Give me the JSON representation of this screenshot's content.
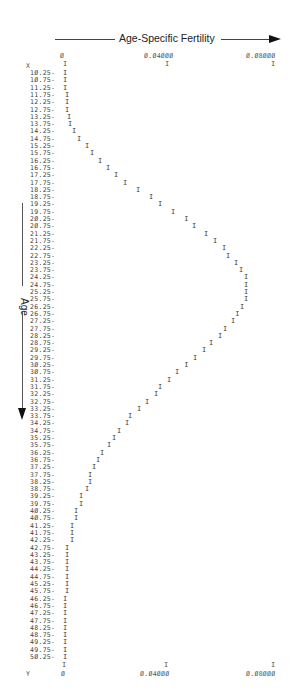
{
  "chart_data": {
    "type": "line",
    "title": "Age-Specific Fertility",
    "xlabel": "Age-Specific Fertility",
    "ylabel": "Age",
    "orientation": "horizontal-value-axis, vertical-age-axis (line printer plot)",
    "value_axis": {
      "ticks": [
        "0",
        "0.04000",
        "0.08000"
      ],
      "tick_display": [
        "Ø",
        "Ø.Ø4ØØØ",
        "Ø.Ø8ØØØ"
      ],
      "range": [
        0,
        0.08
      ]
    },
    "corner_labels": {
      "top_left": "X",
      "bottom_left": "Y"
    },
    "plot_symbol": "I",
    "ages": [
      10.25,
      10.75,
      11.25,
      11.75,
      12.25,
      12.75,
      13.25,
      13.75,
      14.25,
      14.75,
      15.25,
      15.75,
      16.25,
      16.75,
      17.25,
      17.75,
      18.25,
      18.75,
      19.25,
      19.75,
      20.25,
      20.75,
      21.25,
      21.75,
      22.25,
      22.75,
      23.25,
      23.75,
      24.25,
      24.75,
      25.25,
      25.75,
      26.25,
      26.75,
      27.25,
      27.75,
      28.25,
      28.75,
      29.25,
      29.75,
      30.25,
      30.75,
      31.25,
      31.75,
      32.25,
      32.75,
      33.25,
      33.75,
      34.25,
      34.75,
      35.25,
      35.75,
      36.25,
      36.75,
      37.25,
      37.75,
      38.25,
      38.75,
      39.25,
      39.75,
      40.25,
      40.75,
      41.25,
      41.75,
      42.25,
      42.75,
      43.25,
      43.75,
      44.25,
      44.75,
      45.25,
      45.75,
      46.25,
      46.75,
      47.25,
      47.75,
      48.25,
      48.75,
      49.25,
      49.75,
      50.25
    ],
    "age_labels": [
      "1Ø.25-",
      "1Ø.75-",
      "11.25-",
      "11.75-",
      "12.25-",
      "12.75-",
      "13.25-",
      "13.75-",
      "14.25-",
      "14.75-",
      "15.25-",
      "15.75-",
      "16.25-",
      "16.75-",
      "17.25-",
      "17.75-",
      "18.25-",
      "18.75-",
      "19.25-",
      "19.75-",
      "2Ø.25-",
      "2Ø.75-",
      "21.25-",
      "21.75-",
      "22.25-",
      "22.75-",
      "23.25-",
      "23.75-",
      "24.25-",
      "24.75-",
      "25.25-",
      "25.75-",
      "26.25-",
      "26.75-",
      "27.25-",
      "27.75-",
      "28.25-",
      "28.75-",
      "29.25-",
      "29.75-",
      "3Ø.25-",
      "3Ø.75-",
      "31.25-",
      "31.75-",
      "32.25-",
      "32.75-",
      "33.25-",
      "33.75-",
      "34.25-",
      "34.75-",
      "35.25-",
      "35.75-",
      "36.25-",
      "36.75-",
      "37.25-",
      "37.75-",
      "38.25-",
      "38.75-",
      "39.25-",
      "39.75-",
      "4Ø.25-",
      "4Ø.75-",
      "41.25-",
      "41.75-",
      "42.25-",
      "42.75-",
      "43.25-",
      "43.75-",
      "44.25-",
      "44.75-",
      "45.25-",
      "45.75-",
      "46.25-",
      "46.75-",
      "47.25-",
      "47.75-",
      "48.25-",
      "48.75-",
      "49.25-",
      "49.75-",
      "5Ø.25-"
    ],
    "values": [
      0.0,
      0.0,
      0.0,
      0.0008,
      0.0008,
      0.0008,
      0.0016,
      0.002,
      0.0035,
      0.0055,
      0.0086,
      0.0106,
      0.0137,
      0.0169,
      0.02,
      0.0235,
      0.0286,
      0.0337,
      0.0373,
      0.0424,
      0.0475,
      0.0506,
      0.0553,
      0.0588,
      0.0624,
      0.0639,
      0.0671,
      0.069,
      0.071,
      0.071,
      0.071,
      0.071,
      0.0694,
      0.0675,
      0.0659,
      0.0627,
      0.0608,
      0.0573,
      0.0545,
      0.051,
      0.0475,
      0.0439,
      0.0408,
      0.0373,
      0.0357,
      0.0322,
      0.029,
      0.0255,
      0.0243,
      0.0212,
      0.0192,
      0.0173,
      0.0145,
      0.0129,
      0.0114,
      0.0098,
      0.0098,
      0.0086,
      0.0063,
      0.0063,
      0.0043,
      0.0043,
      0.0027,
      0.0027,
      0.0027,
      0.0008,
      0.0008,
      0.0008,
      0.0008,
      0.0008,
      0.0008,
      0.0008,
      0.0,
      0.0,
      0.0,
      0.0,
      0.0,
      0.0,
      0.0,
      0.0,
      0.0
    ],
    "grid": false,
    "legend": null
  },
  "layout": {
    "x0_px": 63,
    "x_per_unit_px": 2550,
    "row_top_px": 69,
    "row_step_px": 7.3
  }
}
